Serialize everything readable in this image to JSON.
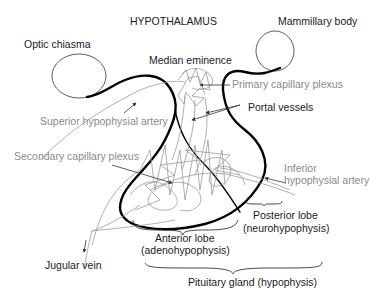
{
  "diagram": {
    "title": "HYPOTHALAMUS",
    "labels": {
      "mammillary_body": "Mammillary body",
      "optic_chiasma": "Optic chiasma",
      "median_eminence": "Median eminence",
      "primary_capillary_plexus": "Primary capillary plexus",
      "portal_vessels": "Portal vessels",
      "superior_hypophysial_artery": "Superior hypophysial artery",
      "secondary_capillary_plexus": "Secondary capillary plexus",
      "inferior_hypophysial_artery_line1": "Inferior",
      "inferior_hypophysial_artery_line2": "hypophysial artery",
      "posterior_lobe_line1": "Posterior lobe",
      "posterior_lobe_line2": "(neurohypophysis)",
      "anterior_lobe_line1": "Anterior lobe",
      "anterior_lobe_line2": "(adenohypophysis)",
      "jugular_vein": "Jugular vein",
      "pituitary_gland": "Pituitary gland (hypophysis)"
    },
    "colors": {
      "outline": "#000000",
      "vessel": "#9a9a9a",
      "gray_label": "#8a8a8a",
      "dark_label": "#1a1a1a"
    }
  }
}
